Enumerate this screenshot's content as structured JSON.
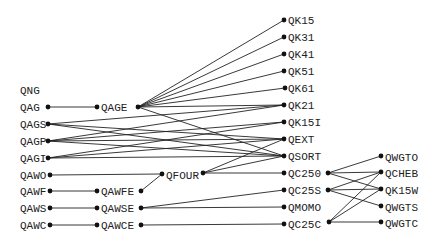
{
  "diagram": {
    "type": "call-graph",
    "nodes": [
      {
        "id": "QNG",
        "label": "QNG",
        "x": 20,
        "y": 90,
        "in": null,
        "out": null
      },
      {
        "id": "QAG",
        "label": "QAG",
        "x": 20,
        "y": 107,
        "in": null,
        "out": [
          48,
          107
        ]
      },
      {
        "id": "QAGS",
        "label": "QAGS",
        "x": 20,
        "y": 124,
        "in": null,
        "out": [
          48,
          124
        ]
      },
      {
        "id": "QAGP",
        "label": "QAGP",
        "x": 20,
        "y": 141,
        "in": null,
        "out": [
          48,
          141
        ]
      },
      {
        "id": "QAGI",
        "label": "QAGI",
        "x": 20,
        "y": 158,
        "in": null,
        "out": [
          48,
          158
        ]
      },
      {
        "id": "QAWO",
        "label": "QAWO",
        "x": 20,
        "y": 175,
        "in": null,
        "out": [
          50,
          175
        ]
      },
      {
        "id": "QAWF",
        "label": "QAWF",
        "x": 20,
        "y": 191,
        "in": null,
        "out": [
          50,
          191
        ]
      },
      {
        "id": "QAWS",
        "label": "QAWS",
        "x": 20,
        "y": 208,
        "in": null,
        "out": [
          50,
          208
        ]
      },
      {
        "id": "QAWC",
        "label": "QAWC",
        "x": 20,
        "y": 225,
        "in": null,
        "out": [
          50,
          225
        ]
      },
      {
        "id": "QAGE",
        "label": "QAGE",
        "x": 101,
        "y": 107,
        "in": [
          97,
          107
        ],
        "out": [
          138,
          107
        ]
      },
      {
        "id": "QAWFE",
        "label": "QAWFE",
        "x": 101,
        "y": 191,
        "in": [
          97,
          191
        ],
        "out": [
          141,
          191
        ]
      },
      {
        "id": "QAWSE",
        "label": "QAWSE",
        "x": 101,
        "y": 208,
        "in": [
          97,
          208
        ],
        "out": [
          141,
          208
        ]
      },
      {
        "id": "QAWCE",
        "label": "QAWCE",
        "x": 101,
        "y": 225,
        "in": [
          97,
          225
        ],
        "out": [
          141,
          225
        ]
      },
      {
        "id": "QFOUR",
        "label": "QFOUR",
        "x": 166,
        "y": 175,
        "in": [
          162,
          174
        ],
        "out": [
          203,
          173
        ]
      },
      {
        "id": "QK15",
        "label": "QK15",
        "x": 288,
        "y": 20,
        "in": [
          284,
          20
        ],
        "out": null
      },
      {
        "id": "QK31",
        "label": "QK31",
        "x": 288,
        "y": 37,
        "in": [
          284,
          37
        ],
        "out": null
      },
      {
        "id": "QK41",
        "label": "QK41",
        "x": 288,
        "y": 54,
        "in": [
          284,
          54
        ],
        "out": null
      },
      {
        "id": "QK51",
        "label": "QK51",
        "x": 288,
        "y": 71,
        "in": [
          284,
          71
        ],
        "out": null
      },
      {
        "id": "QK61",
        "label": "QK61",
        "x": 288,
        "y": 88,
        "in": [
          285,
          88
        ],
        "out": null
      },
      {
        "id": "QK21",
        "label": "QK21",
        "x": 288,
        "y": 105,
        "in": [
          284,
          105
        ],
        "out": null
      },
      {
        "id": "QK15I",
        "label": "QK15I",
        "x": 288,
        "y": 122,
        "in": [
          284,
          122
        ],
        "out": null
      },
      {
        "id": "QEXT",
        "label": "QEXT",
        "x": 288,
        "y": 139,
        "in": [
          284,
          139
        ],
        "out": null
      },
      {
        "id": "QSORT",
        "label": "QSORT",
        "x": 288,
        "y": 156,
        "in": [
          284,
          156
        ],
        "out": null
      },
      {
        "id": "QC250",
        "label": "QC250",
        "x": 288,
        "y": 173,
        "in": [
          284,
          173
        ],
        "out": [
          328,
          173
        ]
      },
      {
        "id": "QC25S",
        "label": "QC25S",
        "x": 288,
        "y": 190,
        "in": [
          284,
          190
        ],
        "out": [
          328,
          190
        ]
      },
      {
        "id": "QMOMO",
        "label": "QMOMO",
        "x": 288,
        "y": 207,
        "in": [
          284,
          207
        ],
        "out": null
      },
      {
        "id": "QC25C",
        "label": "QC25C",
        "x": 288,
        "y": 224,
        "in": [
          284,
          224
        ],
        "out": [
          329,
          222
        ]
      },
      {
        "id": "QWGTO",
        "label": "QWGTO",
        "x": 385,
        "y": 157,
        "in": [
          381,
          156
        ],
        "out": null
      },
      {
        "id": "QCHEB",
        "label": "QCHEB",
        "x": 385,
        "y": 173,
        "in": [
          381,
          172
        ],
        "out": null
      },
      {
        "id": "QK15W",
        "label": "QK15W",
        "x": 385,
        "y": 190,
        "in": [
          381,
          189
        ],
        "out": null
      },
      {
        "id": "QWGTS",
        "label": "QWGTS",
        "x": 385,
        "y": 207,
        "in": [
          381,
          206
        ],
        "out": null
      },
      {
        "id": "QWGTC",
        "label": "QWGTC",
        "x": 385,
        "y": 223,
        "in": [
          381,
          222
        ],
        "out": null
      }
    ],
    "edges": [
      [
        "QAG",
        "QAGE"
      ],
      [
        "QAGE",
        "QK15"
      ],
      [
        "QAGE",
        "QK31"
      ],
      [
        "QAGE",
        "QK41"
      ],
      [
        "QAGE",
        "QK51"
      ],
      [
        "QAGE",
        "QK61"
      ],
      [
        "QAGE",
        "QK21"
      ],
      [
        "QAGE",
        "QSORT"
      ],
      [
        "QAGS",
        "QK21"
      ],
      [
        "QAGS",
        "QEXT"
      ],
      [
        "QAGS",
        "QSORT"
      ],
      [
        "QAGP",
        "QK21"
      ],
      [
        "QAGP",
        "QK15I"
      ],
      [
        "QAGP",
        "QEXT"
      ],
      [
        "QAGP",
        "QSORT"
      ],
      [
        "QAGI",
        "QK15I"
      ],
      [
        "QAGI",
        "QEXT"
      ],
      [
        "QAGI",
        "QSORT"
      ],
      [
        "QAWO",
        "QFOUR"
      ],
      [
        "QAWF",
        "QAWFE"
      ],
      [
        "QAWFE",
        "QFOUR"
      ],
      [
        "QAWS",
        "QAWSE"
      ],
      [
        "QAWSE",
        "QC25S"
      ],
      [
        "QAWSE",
        "QMOMO"
      ],
      [
        "QAWC",
        "QAWCE"
      ],
      [
        "QAWCE",
        "QC25C"
      ],
      [
        "QFOUR",
        "QEXT"
      ],
      [
        "QFOUR",
        "QSORT"
      ],
      [
        "QFOUR",
        "QC250"
      ],
      [
        "QC250",
        "QWGTO"
      ],
      [
        "QC250",
        "QCHEB"
      ],
      [
        "QC250",
        "QK15W"
      ],
      [
        "QC25S",
        "QCHEB"
      ],
      [
        "QC25S",
        "QK15W"
      ],
      [
        "QC25S",
        "QWGTS"
      ],
      [
        "QC25C",
        "QCHEB"
      ],
      [
        "QC25C",
        "QK15W"
      ],
      [
        "QC25C",
        "QWGTC"
      ]
    ]
  }
}
